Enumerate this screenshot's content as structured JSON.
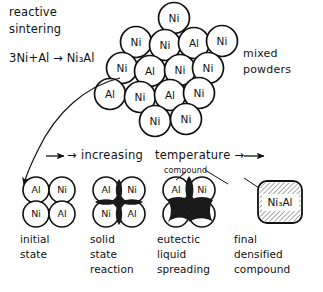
{
  "figure": {
    "title_lines": [
      "reactive",
      "sintering"
    ],
    "equation": "3Ni+Al → Ni₃Al",
    "mixed_powders_lines": [
      "mixed",
      "powders"
    ],
    "axis_label": "→ increasing   temperature →",
    "compound_label": "compound"
  },
  "cluster": {
    "name": "mixed-powder-cluster",
    "particles": [
      {
        "label": "Ni",
        "cx": 174,
        "cy": 18,
        "r": 15.5
      },
      {
        "label": "Ni",
        "cx": 136,
        "cy": 42,
        "r": 15.5
      },
      {
        "label": "Ni",
        "cx": 165,
        "cy": 45,
        "r": 15.5
      },
      {
        "label": "Al",
        "cx": 194,
        "cy": 43,
        "r": 15.5
      },
      {
        "label": "Ni",
        "cx": 222,
        "cy": 41,
        "r": 15.5
      },
      {
        "label": "Ni",
        "cx": 122,
        "cy": 68,
        "r": 15.5
      },
      {
        "label": "Al",
        "cx": 150,
        "cy": 71,
        "r": 15.5
      },
      {
        "label": "Ni",
        "cx": 180,
        "cy": 70,
        "r": 15.5
      },
      {
        "label": "Ni",
        "cx": 208,
        "cy": 68,
        "r": 15.5
      },
      {
        "label": "Al",
        "cx": 110,
        "cy": 94,
        "r": 15.5
      },
      {
        "label": "Ni",
        "cx": 140,
        "cy": 97,
        "r": 15.5
      },
      {
        "label": "Al",
        "cx": 170,
        "cy": 95,
        "r": 15.5
      },
      {
        "label": "Ni",
        "cx": 199,
        "cy": 93,
        "r": 15.5
      },
      {
        "label": "Ni",
        "cx": 155,
        "cy": 121,
        "r": 15.5
      },
      {
        "label": "Ni",
        "cx": 186,
        "cy": 119,
        "r": 15.5
      }
    ]
  },
  "stages": [
    {
      "id": "initial-state",
      "caption_lines": [
        "initial",
        "state"
      ],
      "particles": [
        {
          "label": "Al",
          "cx": 36,
          "cy": 190,
          "r": 13
        },
        {
          "label": "Ni",
          "cx": 62,
          "cy": 190,
          "r": 13
        },
        {
          "label": "Ni",
          "cx": 36,
          "cy": 214,
          "r": 13
        },
        {
          "label": "Al",
          "cx": 62,
          "cy": 214,
          "r": 13
        }
      ]
    },
    {
      "id": "solid-state-reaction",
      "caption_lines": [
        "solid",
        "state",
        "reaction"
      ],
      "particles": [
        {
          "label": "Al",
          "cx": 106,
          "cy": 190,
          "r": 13
        },
        {
          "label": "Ni",
          "cx": 132,
          "cy": 190,
          "r": 13
        },
        {
          "label": "Ni",
          "cx": 106,
          "cy": 214,
          "r": 13
        },
        {
          "label": "Al",
          "cx": 132,
          "cy": 214,
          "r": 13
        }
      ]
    },
    {
      "id": "eutectic-liquid-spreading",
      "caption_lines": [
        "eutectic",
        "liquid",
        "spreading"
      ],
      "particles": [
        {
          "label": "Al",
          "cx": 176,
          "cy": 190,
          "r": 13
        },
        {
          "label": "Ni",
          "cx": 202,
          "cy": 190,
          "r": 13
        },
        {
          "label": "Ni",
          "cx": 176,
          "cy": 214,
          "r": 13
        },
        {
          "label": "Al",
          "cx": 202,
          "cy": 214,
          "r": 13
        }
      ]
    },
    {
      "id": "final-densified-compound",
      "caption_lines": [
        "final",
        "densified",
        "compound"
      ],
      "box_label": "Ni₃Al"
    }
  ],
  "colors": {
    "ink": "#111111",
    "paper": "#ffffff",
    "melt": "#1a1a1a"
  }
}
